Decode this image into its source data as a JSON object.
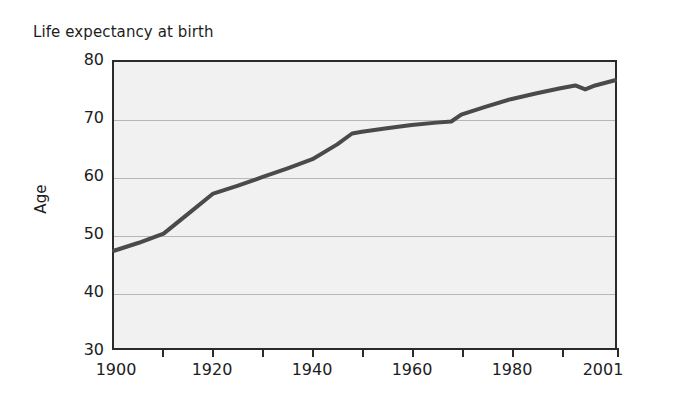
{
  "chart_data": {
    "type": "line",
    "title": "Life expectancy at birth",
    "xlabel": "",
    "ylabel": "Age",
    "xlim": [
      1900,
      2001
    ],
    "ylim": [
      30,
      80
    ],
    "grid": true,
    "legend": false,
    "legend_position": "none",
    "line_color": "#4a4a4a",
    "plot_background": "#f1f1f1",
    "axis_color": "#2b2b2b",
    "gridline_color": "#b6b6b6",
    "y_ticks": [
      80,
      70,
      60,
      50,
      40,
      30
    ],
    "y_tick_labels": [
      "80",
      "70",
      "60",
      "50",
      "40",
      "30"
    ],
    "x_ticks": [
      1900,
      1910,
      1920,
      1930,
      1940,
      1950,
      1960,
      1970,
      1980,
      1990,
      2001
    ],
    "x_tick_labels": [
      "1900",
      "1920",
      "1940",
      "1960",
      "1980",
      "2001"
    ],
    "x_labeled_ticks": [
      1900,
      1920,
      1940,
      1960,
      1980,
      2001
    ],
    "series": [
      {
        "name": "Life expectancy at birth",
        "x": [
          1900,
          1905,
          1910,
          1915,
          1920,
          1925,
          1930,
          1935,
          1940,
          1945,
          1948,
          1950,
          1955,
          1960,
          1965,
          1968,
          1970,
          1975,
          1980,
          1985,
          1990,
          1993,
          1995,
          1997,
          2001
        ],
        "values": [
          47.0,
          48.4,
          50.0,
          53.5,
          57.0,
          58.4,
          59.9,
          61.4,
          63.0,
          65.6,
          67.5,
          67.8,
          68.4,
          69.0,
          69.4,
          69.6,
          70.8,
          72.2,
          73.5,
          74.5,
          75.4,
          75.9,
          75.2,
          75.9,
          76.8
        ]
      }
    ]
  }
}
